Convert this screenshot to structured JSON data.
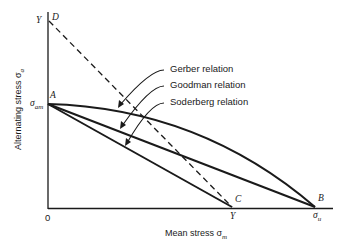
{
  "diagram": {
    "axes": {
      "x_label": "Mean stress σ",
      "x_label_sub": "m",
      "y_label": "Alternating stress σ",
      "y_label_sub": "a",
      "origin_label": "0"
    },
    "points": {
      "D": "D",
      "A": "A",
      "C": "C",
      "B": "B"
    },
    "tick_labels": {
      "y_top": "Y",
      "y_am": "σ",
      "y_am_sub": "am",
      "x_yield": "Y",
      "x_ultimate": "σ",
      "x_ultimate_sub": "u"
    },
    "relations": [
      {
        "name": "gerber",
        "label": "Gerber relation",
        "shape": "parabola A→B"
      },
      {
        "name": "goodman",
        "label": "Goodman relation",
        "shape": "line A→B"
      },
      {
        "name": "soderberg",
        "label": "Soderberg relation",
        "shape": "line A→C"
      }
    ],
    "yield_line": {
      "shape": "dashed line D→C"
    },
    "colors": {
      "line": "#1a1a1a",
      "background": "#ffffff"
    }
  }
}
